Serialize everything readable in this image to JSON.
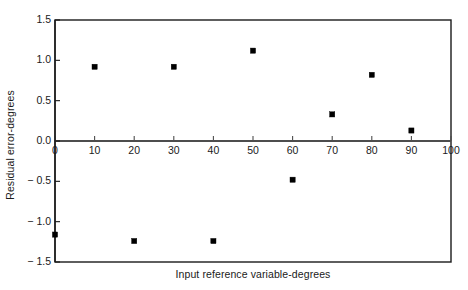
{
  "chart_data": {
    "type": "scatter",
    "title": "",
    "xlabel": "Input reference variable-degrees",
    "ylabel": "Residual error-degrees",
    "xlim": [
      0,
      100
    ],
    "ylim": [
      -1.5,
      1.5
    ],
    "xticks": [
      0,
      10,
      20,
      30,
      40,
      50,
      60,
      70,
      80,
      90,
      100
    ],
    "xtick_labels": [
      "0",
      "10",
      "20",
      "30",
      "40",
      "50",
      "60",
      "70",
      "80",
      "90",
      "100"
    ],
    "yticks": [
      1.5,
      1.0,
      0.5,
      0.0,
      -0.5,
      -1.0,
      -1.5
    ],
    "ytick_labels": [
      "1.5",
      "1.0",
      "0.5",
      "0.0",
      "− 0.5",
      "− 1.0",
      "− 1.5"
    ],
    "grid": false,
    "legend": null,
    "marker": "square",
    "marker_color": "#000000",
    "frame_color": "#1a1a1a",
    "axis_color": "#4d4d4d",
    "background": "#ffffff",
    "x": [
      0,
      10,
      20,
      30,
      40,
      50,
      60,
      70,
      80,
      90
    ],
    "y": [
      -1.16,
      0.92,
      -1.24,
      0.92,
      -1.24,
      1.12,
      -0.48,
      0.33,
      0.82,
      0.13
    ],
    "points": [
      {
        "x": 0,
        "y": -1.16
      },
      {
        "x": 10,
        "y": 0.92
      },
      {
        "x": 20,
        "y": -1.24
      },
      {
        "x": 30,
        "y": 0.92
      },
      {
        "x": 40,
        "y": -1.24
      },
      {
        "x": 50,
        "y": 1.12
      },
      {
        "x": 60,
        "y": -0.48
      },
      {
        "x": 70,
        "y": 0.33
      },
      {
        "x": 80,
        "y": 0.82
      },
      {
        "x": 90,
        "y": 0.13
      }
    ]
  }
}
